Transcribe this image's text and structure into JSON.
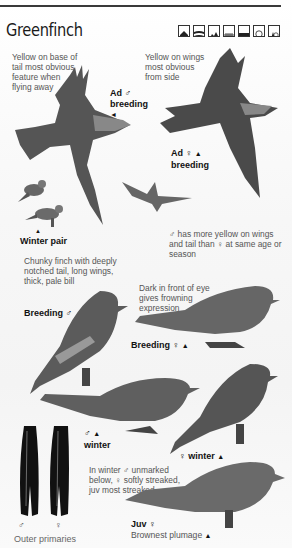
{
  "header": {
    "title": "Greenfinch",
    "habitat_icons": [
      {
        "name": "garden-house-icon"
      },
      {
        "name": "farmland-icon"
      },
      {
        "name": "hills-icon"
      },
      {
        "name": "reedbed-icon"
      },
      {
        "name": "wetland-water-icon"
      },
      {
        "name": "deciduous-woodland-icon"
      },
      {
        "name": "mixed-woodland-icon"
      }
    ]
  },
  "captions": {
    "tail_note": "Yellow on base of tail most obvious feature when flying away",
    "wings_note": "Yellow on wings most obvious from side",
    "male_yellow_note_a": "has more yellow on",
    "male_yellow_note_b": "wings and tail than",
    "male_yellow_note_c": "at",
    "male_yellow_note_d": "same age or season",
    "chunky_note": "Chunky finch with deeply notched tail, long wings, thick, pale bill",
    "frown_note_prefix": "Dark in front of eye gives frowning expression",
    "winter_note_a": "In winter",
    "winter_note_b": "unmarked",
    "winter_note_c": "below,",
    "winter_note_d": "softly streaked,",
    "winter_note_e": "juv most streaked",
    "outer_primaries": "Outer primaries"
  },
  "labels": {
    "ad_male_breeding_1": "Ad",
    "ad_male_breeding_2": "breeding",
    "ad_female_breeding_1": "Ad",
    "ad_female_breeding_2": "breeding",
    "winter_pair": "Winter pair",
    "breeding_male": "Breeding",
    "breeding_female": "Breeding",
    "male_winter": "winter",
    "female_winter": "winter",
    "juv": "Juv",
    "juv_note": "Brownest plumage"
  },
  "symbols": {
    "male": "♂",
    "female": "♀",
    "triangle": "▲",
    "arrow_left": "◄"
  },
  "colors": {
    "rule": "#3a3a3a",
    "text_caption": "#555555",
    "text_label": "#111111"
  }
}
